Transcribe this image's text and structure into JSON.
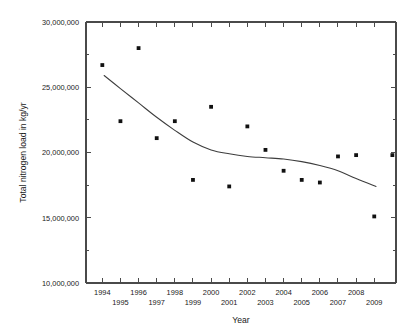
{
  "chart_data": {
    "type": "scatter",
    "title": "",
    "xlabel": "Year",
    "ylabel": "Total nitrogen load in kg/yr",
    "xlim": [
      1993.1,
      2010.2
    ],
    "ylim": [
      10000000,
      30000000
    ],
    "grid": false,
    "legend": null,
    "y_ticks": [
      10000000,
      15000000,
      20000000,
      25000000,
      30000000
    ],
    "y_tick_labels": [
      "10,000,000",
      "15,000,000",
      "20,000,000",
      "25,000,000",
      "30,000,000"
    ],
    "y_minor_ticks": [
      12500000,
      17500000,
      22500000,
      27500000
    ],
    "x_ticks": [
      1994,
      1995,
      1996,
      1997,
      1998,
      1999,
      2000,
      2001,
      2002,
      2003,
      2004,
      2005,
      2006,
      2007,
      2008,
      2009
    ],
    "x_tick_labels": [
      "1994",
      "1995",
      "1996",
      "1997",
      "1998",
      "1999",
      "2000",
      "2001",
      "2002",
      "2003",
      "2004",
      "2005",
      "2006",
      "2007",
      "2008",
      "2009"
    ],
    "series": [
      {
        "name": "Total nitrogen load",
        "marker": "square",
        "color": "#111111",
        "x": [
          1994,
          1995,
          1996,
          1997,
          1998,
          1999,
          2000,
          2001,
          2002,
          2003,
          2004,
          2005,
          2006,
          2007,
          2008,
          2009,
          2010
        ],
        "values": [
          26700000,
          22400000,
          28000000,
          21100000,
          22400000,
          17900000,
          23500000,
          17400000,
          22000000,
          20200000,
          18600000,
          17900000,
          17700000,
          19700000,
          19800000,
          15100000,
          19800000
        ]
      },
      {
        "name": "Trend line",
        "marker": "none",
        "color": "#3d3d3d",
        "x": [
          1994.1,
          1995,
          1996,
          1997,
          1998,
          1999,
          2000,
          2001,
          2002,
          2003,
          2004,
          2005,
          2006,
          2007,
          2008,
          2009.1
        ],
        "values": [
          25900000,
          24900000,
          23800000,
          22700000,
          21700000,
          20800000,
          20200000,
          19900000,
          19700000,
          19600000,
          19500000,
          19300000,
          19000000,
          18600000,
          18000000,
          17400000
        ]
      }
    ]
  }
}
